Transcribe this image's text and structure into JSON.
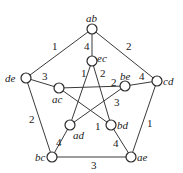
{
  "nodes": [
    {
      "id": "ab",
      "label": "ab",
      "x": 92,
      "y": 29,
      "lx": 86,
      "ly": 22
    },
    {
      "id": "ec",
      "label": "ec",
      "x": 92,
      "y": 61,
      "lx": 97,
      "ly": 62
    },
    {
      "id": "de",
      "label": "de",
      "x": 26,
      "y": 78,
      "lx": 5,
      "ly": 82
    },
    {
      "id": "ac",
      "label": "ac",
      "x": 59,
      "y": 88,
      "lx": 52,
      "ly": 103
    },
    {
      "id": "be",
      "label": "be",
      "x": 125,
      "y": 86,
      "lx": 120,
      "ly": 80
    },
    {
      "id": "cd",
      "label": "cd",
      "x": 157,
      "y": 81,
      "lx": 163,
      "ly": 85
    },
    {
      "id": "ad",
      "label": "ad",
      "x": 70,
      "y": 125,
      "lx": 73,
      "ly": 139
    },
    {
      "id": "bd",
      "label": "bd",
      "x": 111,
      "y": 125,
      "lx": 117,
      "ly": 129
    },
    {
      "id": "bc",
      "label": "bc",
      "x": 52,
      "y": 157,
      "lx": 35,
      "ly": 161
    },
    {
      "id": "ae",
      "label": "ae",
      "x": 131,
      "y": 157,
      "lx": 137,
      "ly": 161
    }
  ],
  "edges": [
    {
      "from": "ab",
      "to": "de",
      "weight": "1",
      "wx": 52,
      "wy": 50
    },
    {
      "from": "ab",
      "to": "cd",
      "weight": "2",
      "wx": 126,
      "wy": 50
    },
    {
      "from": "ab",
      "to": "ec",
      "weight": "4",
      "wx": 84,
      "wy": 50
    },
    {
      "from": "de",
      "to": "ac",
      "weight": "3",
      "wx": 42,
      "wy": 80
    },
    {
      "from": "de",
      "to": "bc",
      "weight": "2",
      "wx": 29,
      "wy": 123
    },
    {
      "from": "cd",
      "to": "be",
      "weight": "4",
      "wx": 139,
      "wy": 80
    },
    {
      "from": "cd",
      "to": "ae",
      "weight": "1",
      "wx": 147,
      "wy": 127
    },
    {
      "from": "bc",
      "to": "ae",
      "weight": "3",
      "wx": 91,
      "wy": 169
    },
    {
      "from": "bc",
      "to": "ad",
      "weight": "4",
      "wx": 56,
      "wy": 146
    },
    {
      "from": "ae",
      "to": "bd",
      "weight": "4",
      "wx": 113,
      "wy": 147
    },
    {
      "from": "ec",
      "to": "ad",
      "weight": "1",
      "wx": 81,
      "wy": 77
    },
    {
      "from": "ec",
      "to": "bd",
      "weight": "2",
      "wx": 100,
      "wy": 77
    },
    {
      "from": "ac",
      "to": "be",
      "weight": "2",
      "wx": 111,
      "wy": 86
    },
    {
      "from": "ac",
      "to": "bd",
      "weight": "1",
      "wx": 95,
      "wy": 130
    },
    {
      "from": "be",
      "to": "ad",
      "weight": "3",
      "wx": 114,
      "wy": 106
    }
  ]
}
